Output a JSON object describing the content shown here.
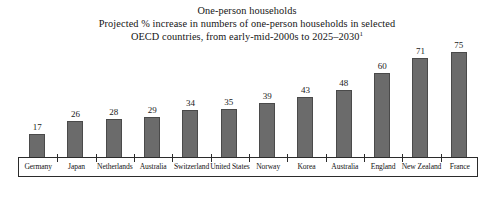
{
  "chart_data": {
    "type": "bar",
    "title": "One-person households",
    "subtitle_lines": [
      "One-person households",
      "Projected % increase in numbers of one-person households in selected",
      "OECD countries, from early-mid-2000s to 2025–2030"
    ],
    "footnote_marker": "1",
    "categories": [
      "Germany",
      "Japan",
      "Netherlands",
      "Australia",
      "Switzerland",
      "United States",
      "Norway",
      "Korea",
      "Australia",
      "England",
      "New Zealand",
      "France"
    ],
    "values": [
      17,
      26,
      28,
      29,
      34,
      35,
      39,
      43,
      48,
      60,
      71,
      75
    ],
    "xlabel": "",
    "ylabel": "",
    "ylim": [
      0,
      78
    ],
    "grid": false,
    "legend": false,
    "bar_color": "#6b6b6b",
    "bar_edge_color": "#4a4a4a",
    "axis_color": "#2b2b2b",
    "background_color": "#ffffff"
  }
}
